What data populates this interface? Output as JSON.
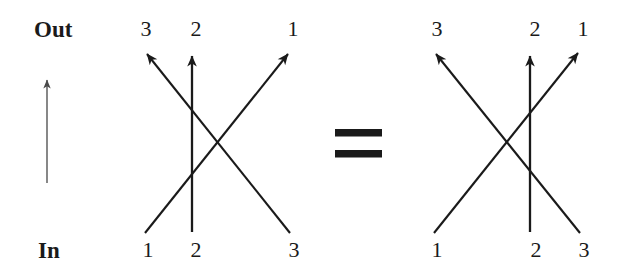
{
  "figure": {
    "type": "permutation-wiring-diagram-identity",
    "axis": {
      "out_label": "Out",
      "in_label": "In",
      "direction_arrow_icon": "up-arrow-icon"
    },
    "relation_symbol": "=",
    "relation_icon": "equals-sign-icon",
    "diagrams": [
      {
        "id": "left",
        "top_labels": [
          "3",
          "2",
          "1"
        ],
        "bottom_labels": [
          "1",
          "2",
          "3"
        ],
        "wires": [
          {
            "from": "1",
            "to": "1",
            "kind": "diagonal-up-right"
          },
          {
            "from": "2",
            "to": "2",
            "kind": "vertical"
          },
          {
            "from": "3",
            "to": "3",
            "kind": "diagonal-up-left"
          }
        ]
      },
      {
        "id": "right",
        "top_labels": [
          "3",
          "2",
          "1"
        ],
        "bottom_labels": [
          "1",
          "2",
          "3"
        ],
        "wires": [
          {
            "from": "1",
            "to": "1",
            "kind": "diagonal-up-right"
          },
          {
            "from": "2",
            "to": "2",
            "kind": "vertical"
          },
          {
            "from": "3",
            "to": "3",
            "kind": "diagonal-up-left"
          }
        ]
      }
    ],
    "colors": {
      "ink": "#1a1a1a",
      "background": "#ffffff"
    }
  },
  "geometry": {
    "left_diagram": {
      "top_y": 51,
      "bottom_y": 233,
      "x_positions": [
        145,
        192,
        290
      ]
    },
    "right_diagram": {
      "top_y": 51,
      "bottom_y": 233,
      "x_positions": [
        434,
        530,
        580
      ]
    },
    "direction_arrow": {
      "x": 47,
      "top_y": 78,
      "bottom_y": 183
    },
    "equals": {
      "x1": 335,
      "x2": 382,
      "y1": 133,
      "y2": 154
    }
  }
}
